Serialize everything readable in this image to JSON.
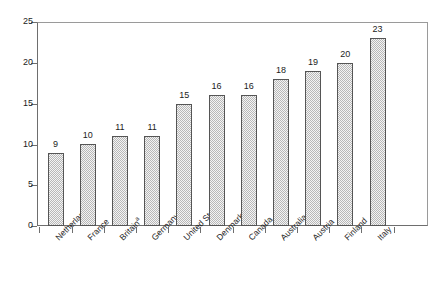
{
  "chart_data": {
    "type": "bar",
    "title": "",
    "subtitle": "",
    "xlabel": "",
    "ylabel": "",
    "ylim": [
      0,
      25
    ],
    "yticks": [
      0,
      5,
      10,
      15,
      20,
      25
    ],
    "grid": false,
    "legend": false,
    "orientation": "vertical",
    "categories": [
      "Netherlands",
      "France",
      "Britain",
      "Germany",
      "United States",
      "Denmark",
      "Canada",
      "Australia",
      "Austria",
      "Finland",
      "Italy"
    ],
    "category_footnotes": [
      "",
      "",
      "a",
      "",
      "",
      "",
      "",
      "",
      "",
      "",
      ""
    ],
    "values": [
      9,
      10,
      11,
      11,
      15,
      16,
      16,
      18,
      19,
      20,
      23
    ],
    "data_labels": [
      "9",
      "10",
      "11",
      "11",
      "15",
      "16",
      "16",
      "18",
      "19",
      "20",
      "23"
    ],
    "bar_fill": "#b8b8b8",
    "bar_border": "#555555",
    "axis_color": "#6e6e6e",
    "text_color": "#1c1c1c",
    "background": "#ffffff"
  },
  "axis": {
    "y_tick_labels": [
      "0",
      "5",
      "10",
      "15",
      "20",
      "25"
    ]
  }
}
